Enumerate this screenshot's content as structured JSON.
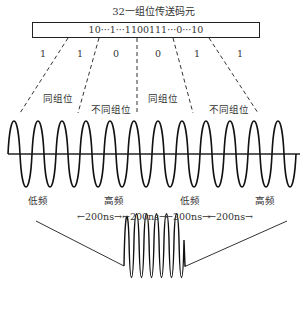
{
  "title": "32一组位传送码元",
  "code_box": "10···1···1100111···0···10",
  "bits": [
    "1",
    "1",
    "0",
    "0",
    "1",
    "1"
  ],
  "group_labels": [
    "同组位",
    "不同组位",
    "同组位",
    "不同组位"
  ],
  "freq_labels": [
    "低频",
    "高频",
    "低频",
    "高频"
  ],
  "durations": [
    "←200ns→",
    "←200ns→",
    "←200ns→",
    "←200ns→"
  ],
  "colors": {
    "line": "#222222",
    "text": "#333333",
    "background": "#ffffff"
  }
}
